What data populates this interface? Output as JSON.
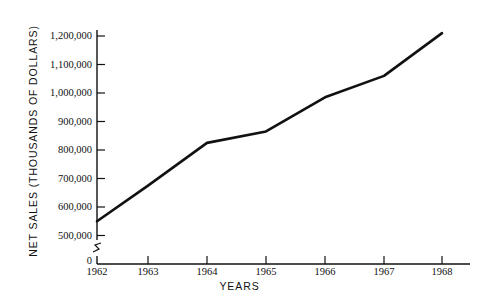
{
  "chart_data": {
    "type": "line",
    "title": "",
    "xlabel": "YEARS",
    "ylabel": "NET SALES (THOUSANDS OF DOLLARS)",
    "categories": [
      "1962",
      "1963",
      "1964",
      "1965",
      "1966",
      "1967",
      "1968"
    ],
    "x": [
      1962,
      1963,
      1964,
      1965,
      1966,
      1967,
      1968
    ],
    "values": [
      550000,
      675000,
      825000,
      865000,
      985000,
      1060000,
      1210000
    ],
    "series": [
      {
        "name": "Net Sales",
        "values": [
          550000,
          675000,
          825000,
          865000,
          985000,
          1060000,
          1210000
        ]
      }
    ],
    "ylim": [
      500000,
      1250000
    ],
    "xlim": [
      1962,
      1968
    ],
    "yticks": [
      500000,
      600000,
      700000,
      800000,
      900000,
      1000000,
      1100000,
      1200000
    ],
    "ytick_labels": [
      "500,000",
      "600,000",
      "700,000",
      "800,000",
      "900,000",
      "1,000,000",
      "1,100,000",
      "1,200,000"
    ],
    "xtick_labels": [
      "1962",
      "1963",
      "1964",
      "1965",
      "1966",
      "1967",
      "1968"
    ],
    "origin_label": "0",
    "axis_break": true,
    "grid": false,
    "legend": false,
    "line_color": "#111111",
    "axis_color": "#111111",
    "background_color": "#ffffff"
  }
}
